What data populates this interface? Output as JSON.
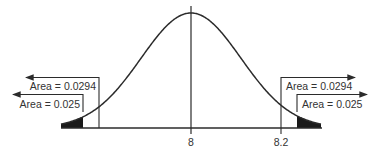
{
  "diagram": {
    "type": "normal-distribution-two-tailed",
    "mean_label": "8",
    "critical_label": "8.2",
    "annotations": {
      "left_outer": "Area = 0.0294",
      "left_inner": "Area = 0.025",
      "right_outer": "Area = 0.0294",
      "right_inner": "Area = 0.025"
    },
    "colors": {
      "line": "#2b2b2b",
      "shade": "#1a1a1a",
      "text": "#333333"
    }
  }
}
